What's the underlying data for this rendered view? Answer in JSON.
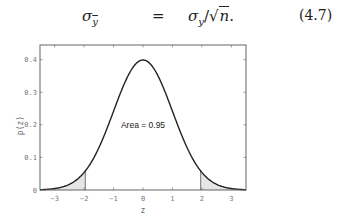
{
  "equation": {
    "lhs_symbol": "σ",
    "lhs_subscript": "y",
    "operator": "=",
    "rhs_symbol": "σ",
    "rhs_subscript": "y",
    "rhs_rest": "/",
    "sqrt_symbol": "√",
    "sqrt_arg": "n",
    "trailing": ".",
    "number": "(4.7)"
  },
  "chart_data": {
    "type": "line",
    "title": "",
    "xlabel": "z",
    "ylabel": "p(z)",
    "xlim": [
      -3.5,
      3.5
    ],
    "ylim": [
      0,
      0.445
    ],
    "xticks": [
      -3,
      -2,
      -1,
      0,
      1,
      2,
      3
    ],
    "xtick_labels": [
      "−3",
      "−2",
      "−1",
      "0",
      "1",
      "2",
      "3"
    ],
    "yticks": [
      0,
      0.1,
      0.2,
      0.3,
      0.4
    ],
    "ytick_labels": [
      "0",
      "0.1",
      "0.2",
      "0.3",
      "0.4"
    ],
    "grid": false,
    "series": [
      {
        "name": "standard normal pdf",
        "function": "p(z) = exp(-z^2/2)/sqrt(2π)",
        "x": [
          -3.5,
          -3,
          -2.5,
          -2,
          -1.5,
          -1,
          -0.5,
          0,
          0.5,
          1,
          1.5,
          2,
          2.5,
          3,
          3.5
        ],
        "values": [
          0.0009,
          0.0044,
          0.0175,
          0.054,
          0.1295,
          0.242,
          0.3521,
          0.3989,
          0.3521,
          0.242,
          0.1295,
          0.054,
          0.0175,
          0.0044,
          0.0009
        ]
      }
    ],
    "shaded_regions": [
      {
        "from": -3.5,
        "to": -1.96,
        "fill": "#e6e6e6"
      },
      {
        "from": 1.96,
        "to": 3.5,
        "fill": "#e6e6e6"
      }
    ],
    "annotations": [
      {
        "text": "Area = 0.95",
        "x": 0,
        "y": 0.2
      }
    ],
    "colors": {
      "curve": "#222222",
      "axes": "#555555",
      "shade": "#e6e6e6"
    }
  }
}
